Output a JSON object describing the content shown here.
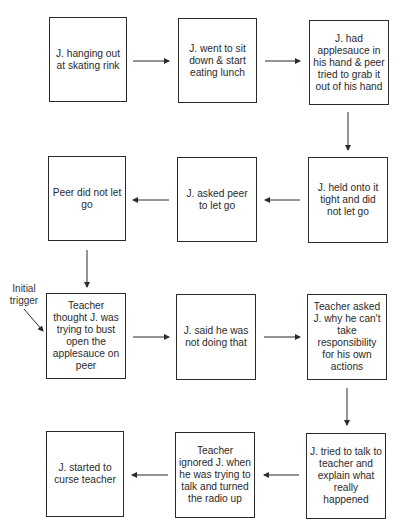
{
  "diagram": {
    "type": "flowchart",
    "annotation": {
      "label": "Initial\ntrigger",
      "points_to": "node_7"
    },
    "nodes": [
      {
        "id": "node_1",
        "text": "J. hanging out at skating rink"
      },
      {
        "id": "node_2",
        "text": "J. went to sit down & start eating lunch"
      },
      {
        "id": "node_3",
        "text": "J. had applesauce in his hand & peer tried to grab it out of his hand"
      },
      {
        "id": "node_4",
        "text": "J. held onto it tight and did not let go"
      },
      {
        "id": "node_5",
        "text": "J. asked peer to let go"
      },
      {
        "id": "node_6",
        "text": "Peer did not let go"
      },
      {
        "id": "node_7",
        "text": "Teacher thought J. was trying to bust open the applesauce on peer"
      },
      {
        "id": "node_8",
        "text": "J. said he was not doing that"
      },
      {
        "id": "node_9",
        "text": "Teacher asked J. why he can't take responsibility for his own actions"
      },
      {
        "id": "node_10",
        "text": "J. tried to talk to teacher and explain what really happened"
      },
      {
        "id": "node_11",
        "text": "Teacher ignored J. when he was trying to talk and turned the radio up"
      },
      {
        "id": "node_12",
        "text": "J. started to curse teacher"
      }
    ],
    "edges": [
      [
        "node_1",
        "node_2"
      ],
      [
        "node_2",
        "node_3"
      ],
      [
        "node_3",
        "node_4"
      ],
      [
        "node_4",
        "node_5"
      ],
      [
        "node_5",
        "node_6"
      ],
      [
        "node_6",
        "node_7"
      ],
      [
        "node_7",
        "node_8"
      ],
      [
        "node_8",
        "node_9"
      ],
      [
        "node_9",
        "node_10"
      ],
      [
        "node_10",
        "node_11"
      ],
      [
        "node_11",
        "node_12"
      ]
    ]
  }
}
